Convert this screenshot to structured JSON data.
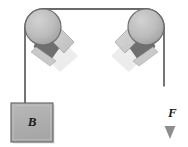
{
  "figure": {
    "type": "physics-free-body-diagram",
    "background_color": "#ffffff"
  },
  "labels": {
    "block": "B",
    "force": "F"
  },
  "colors": {
    "rope": "#3a3a3a",
    "pulley_face": "#b3b3b3",
    "pulley_edge": "#6e6e6e",
    "bracket_dark": "#6b6b6b",
    "bracket_light": "#cfcfcf",
    "block_fill": "#b0b0b0",
    "block_edge": "#6a6a6a",
    "arrow": "#8a8a8a",
    "shadow": "#d9d9d9"
  },
  "elements": {
    "left_pulley": {
      "cx": 43,
      "cy": 27,
      "r": 18
    },
    "right_pulley": {
      "cx": 146,
      "cy": 27,
      "r": 18
    },
    "block": {
      "x": 11,
      "y": 103,
      "width": 42,
      "height": 39
    },
    "force_arrow": {
      "x": 170,
      "y_start": 85,
      "y_end": 137,
      "direction": "down"
    },
    "rope_left_segment": {
      "x": 25,
      "y_top": 27,
      "y_bottom": 103
    },
    "rope_right_segment": {
      "x": 164,
      "y_top": 27,
      "y_bottom": 85
    },
    "rope_top_segment": {
      "x_start": 43,
      "x_end": 146,
      "y": 9
    }
  }
}
